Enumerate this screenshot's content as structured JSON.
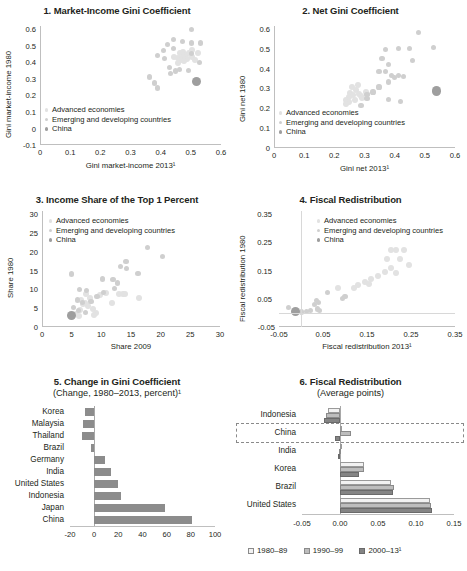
{
  "chart_data": [
    {
      "type": "scatter",
      "panel": "1",
      "title": "1. Market-Income Gini Coefficient",
      "xlabel": "Gini market-income 2013¹",
      "ylabel": "Gini market-income 1980",
      "xlim": [
        0,
        0.6
      ],
      "ylim": [
        -0.1,
        0.6
      ],
      "xticks": [
        "0",
        "0.1",
        "0.2",
        "0.3",
        "0.4",
        "0.5",
        "0.6"
      ],
      "yticks": [
        "-0.1",
        "0",
        "0.1",
        "0.2",
        "0.3",
        "0.4",
        "0.5",
        "0.6"
      ],
      "grid": false,
      "legend": [
        "Advanced economies",
        "Emerging and developing countries",
        "China"
      ],
      "series": [
        {
          "name": "Advanced economies",
          "color": "#e2e2e2",
          "points": [
            [
              0.46,
              0.44
            ],
            [
              0.47,
              0.45
            ],
            [
              0.48,
              0.43
            ],
            [
              0.47,
              0.42
            ],
            [
              0.49,
              0.44
            ],
            [
              0.485,
              0.405
            ],
            [
              0.5,
              0.42
            ],
            [
              0.455,
              0.41
            ],
            [
              0.465,
              0.4
            ],
            [
              0.5,
              0.46
            ],
            [
              0.52,
              0.44
            ],
            [
              0.51,
              0.4
            ],
            [
              0.44,
              0.42
            ],
            [
              0.455,
              0.385
            ],
            [
              0.475,
              0.395
            ]
          ]
        },
        {
          "name": "Emerging and developing countries",
          "color": "#cfcfcf",
          "points": [
            [
              0.5,
              0.58
            ],
            [
              0.44,
              0.52
            ],
            [
              0.47,
              0.51
            ],
            [
              0.42,
              0.49
            ],
            [
              0.5,
              0.5
            ],
            [
              0.53,
              0.5
            ],
            [
              0.405,
              0.455
            ],
            [
              0.44,
              0.47
            ],
            [
              0.385,
              0.425
            ],
            [
              0.41,
              0.41
            ],
            [
              0.5,
              0.44
            ],
            [
              0.525,
              0.385
            ],
            [
              0.425,
              0.355
            ],
            [
              0.46,
              0.345
            ],
            [
              0.49,
              0.34
            ],
            [
              0.445,
              0.335
            ],
            [
              0.36,
              0.3
            ],
            [
              0.375,
              0.265
            ],
            [
              0.385,
              0.235
            ],
            [
              0.43,
              0.32
            ]
          ]
        },
        {
          "name": "China",
          "color": "#9e9e9e",
          "points": [
            [
              0.515,
              0.275
            ]
          ]
        }
      ]
    },
    {
      "type": "scatter",
      "panel": "2",
      "title": "2. Net Gini Coefficient",
      "xlabel": "Gini net 2013¹",
      "ylabel": "Gini net 1980",
      "xlim": [
        0,
        0.6
      ],
      "ylim": [
        0,
        0.6
      ],
      "xticks": [
        "0",
        "0.1",
        "0.2",
        "0.3",
        "0.4",
        "0.5",
        "0.6"
      ],
      "yticks": [
        "0",
        "0.1",
        "0.2",
        "0.3",
        "0.4",
        "0.5",
        "0.6"
      ],
      "grid": false,
      "legend": [
        "Advanced economies",
        "Emerging and developing countries",
        "China"
      ],
      "series": [
        {
          "name": "Advanced economies",
          "color": "#e2e2e2",
          "points": [
            [
              0.25,
              0.27
            ],
            [
              0.26,
              0.26
            ],
            [
              0.255,
              0.3
            ],
            [
              0.27,
              0.285
            ],
            [
              0.28,
              0.265
            ],
            [
              0.245,
              0.25
            ],
            [
              0.265,
              0.235
            ],
            [
              0.285,
              0.255
            ],
            [
              0.235,
              0.235
            ],
            [
              0.3,
              0.275
            ],
            [
              0.275,
              0.31
            ],
            [
              0.29,
              0.245
            ],
            [
              0.245,
              0.225
            ],
            [
              0.305,
              0.265
            ],
            [
              0.235,
              0.215
            ]
          ]
        },
        {
          "name": "Emerging and developing countries",
          "color": "#cfcfcf",
          "points": [
            [
              0.475,
              0.57
            ],
            [
              0.445,
              0.49
            ],
            [
              0.365,
              0.485
            ],
            [
              0.41,
              0.49
            ],
            [
              0.525,
              0.495
            ],
            [
              0.455,
              0.43
            ],
            [
              0.355,
              0.44
            ],
            [
              0.375,
              0.41
            ],
            [
              0.345,
              0.375
            ],
            [
              0.365,
              0.375
            ],
            [
              0.385,
              0.355
            ],
            [
              0.41,
              0.355
            ],
            [
              0.425,
              0.35
            ],
            [
              0.395,
              0.345
            ],
            [
              0.375,
              0.325
            ],
            [
              0.345,
              0.3
            ],
            [
              0.325,
              0.275
            ],
            [
              0.305,
              0.265
            ],
            [
              0.305,
              0.245
            ],
            [
              0.375,
              0.24
            ],
            [
              0.415,
              0.23
            ],
            [
              0.285,
              0.21
            ]
          ]
        },
        {
          "name": "China",
          "color": "#9e9e9e",
          "points": [
            [
              0.535,
              0.28
            ]
          ]
        }
      ]
    },
    {
      "type": "scatter",
      "panel": "3",
      "title": "3. Income Share of the Top 1 Percent",
      "xlabel": "Share 2009",
      "ylabel": "Share 1980",
      "xlim": [
        0,
        30
      ],
      "ylim": [
        0,
        30
      ],
      "xticks": [
        "0",
        "5",
        "10",
        "15",
        "20",
        "25",
        "30"
      ],
      "yticks": [
        "0",
        "5",
        "10",
        "15",
        "20",
        "25",
        "30"
      ],
      "grid": false,
      "legend": [
        "Advanced economies",
        "Emerging and developing countries",
        "China"
      ],
      "series": [
        {
          "name": "Advanced economies",
          "color": "#e2e2e2",
          "points": [
            [
              7.2,
              8.6
            ],
            [
              8.0,
              7.6
            ],
            [
              6.4,
              7.1
            ],
            [
              9.6,
              8.4
            ],
            [
              10.6,
              8.8
            ],
            [
              6.8,
              5.9
            ],
            [
              7.6,
              5.4
            ],
            [
              8.4,
              4.6
            ],
            [
              9.0,
              3.6
            ],
            [
              6.2,
              4.3
            ],
            [
              7.0,
              6.3
            ],
            [
              11.6,
              6.1
            ],
            [
              12.8,
              8.5
            ],
            [
              13.4,
              8.6
            ],
            [
              13.8,
              8.5
            ],
            [
              16.1,
              7.6
            ],
            [
              5.6,
              3.4
            ],
            [
              6.0,
              2.9
            ],
            [
              8.6,
              3.1
            ]
          ]
        },
        {
          "name": "Emerging and developing countries",
          "color": "#cfcfcf",
          "points": [
            [
              17.6,
              20.6
            ],
            [
              20.2,
              18.2
            ],
            [
              13.0,
              15.7
            ],
            [
              14.1,
              15.2
            ],
            [
              14.0,
              16.9
            ],
            [
              16.0,
              13.8
            ],
            [
              10.0,
              12.4
            ],
            [
              11.8,
              12.2
            ],
            [
              12.5,
              11.4
            ],
            [
              4.8,
              13.7
            ],
            [
              6.2,
              9.6
            ],
            [
              7.4,
              9.4
            ],
            [
              5.8,
              7.0
            ],
            [
              6.6,
              6.4
            ],
            [
              8.1,
              6.6
            ],
            [
              9.1,
              7.9
            ],
            [
              10.2,
              9.0
            ],
            [
              12.0,
              9.9
            ],
            [
              5.2,
              5.0
            ],
            [
              6.0,
              4.2
            ],
            [
              7.2,
              3.8
            ]
          ]
        },
        {
          "name": "China",
          "color": "#9e9e9e",
          "points": [
            [
              4.8,
              2.9
            ]
          ]
        }
      ]
    },
    {
      "type": "scatter",
      "panel": "4",
      "title": "4. Fiscal Redistribution",
      "xlabel": "Fiscal redistribution 2013¹",
      "ylabel": "Fiscal redistribution 1980",
      "xlim": [
        -0.05,
        0.35
      ],
      "ylim": [
        -0.05,
        0.35
      ],
      "xticks": [
        "-0.05",
        "0.05",
        "0.15",
        "0.25",
        "0.35"
      ],
      "yticks": [
        "-0.05",
        "0.05",
        "0.15",
        "0.25",
        "0.35"
      ],
      "grid": false,
      "legend": [
        "Advanced economies",
        "Emerging and developing countries",
        "China"
      ],
      "series": [
        {
          "name": "Advanced economies",
          "color": "#e2e2e2",
          "points": [
            [
              0.205,
              0.215
            ],
            [
              0.215,
              0.215
            ],
            [
              0.235,
              0.215
            ],
            [
              0.195,
              0.185
            ],
            [
              0.225,
              0.185
            ],
            [
              0.205,
              0.155
            ],
            [
              0.245,
              0.165
            ],
            [
              0.19,
              0.14
            ],
            [
              0.215,
              0.135
            ],
            [
              0.175,
              0.125
            ],
            [
              0.16,
              0.115
            ],
            [
              0.145,
              0.105
            ],
            [
              0.13,
              0.095
            ],
            [
              0.155,
              0.1
            ],
            [
              0.12,
              0.085
            ],
            [
              0.085,
              0.085
            ]
          ]
        },
        {
          "name": "Emerging and developing countries",
          "color": "#cfcfcf",
          "points": [
            [
              0.1,
              0.055
            ],
            [
              0.095,
              0.048
            ],
            [
              0.035,
              0.04
            ],
            [
              0.04,
              0.035
            ],
            [
              0.03,
              0.028
            ],
            [
              0.038,
              0.012
            ],
            [
              0.022,
              0.006
            ],
            [
              0.012,
              0.004
            ],
            [
              -0.028,
              0.018
            ],
            [
              0.002,
              0.002
            ],
            [
              0.042,
              0.008
            ],
            [
              0.06,
              0.068
            ]
          ]
        },
        {
          "name": "China",
          "color": "#9e9e9e",
          "points": [
            [
              -0.012,
              0.004
            ]
          ]
        }
      ]
    },
    {
      "type": "bar",
      "panel": "5",
      "title": "5. Change in Gini Coefficient",
      "subtitle": "(Change, 1980–2013, percent)¹",
      "orientation": "horizontal",
      "xlabel": "",
      "ylabel": "",
      "xlim": [
        -20,
        100
      ],
      "xticks": [
        "-20",
        "0",
        "20",
        "40",
        "60",
        "80",
        "100"
      ],
      "grid": false,
      "color": "#8c8c8c",
      "categories": [
        "Korea",
        "Malaysia",
        "Thailand",
        "Brazil",
        "Germany",
        "India",
        "United States",
        "Indonesia",
        "Japan",
        "China"
      ],
      "values": [
        -8,
        -9,
        -10,
        -3,
        9,
        14,
        20,
        22,
        59,
        81
      ]
    },
    {
      "type": "bar",
      "panel": "6",
      "title": "6. Fiscal Redistribution",
      "subtitle": "(Average points)",
      "orientation": "horizontal",
      "grouped": true,
      "xlabel": "",
      "ylabel": "",
      "xlim": [
        -0.05,
        0.15
      ],
      "xticks": [
        "-0.05",
        "0.00",
        "0.05",
        "0.10",
        "0.15"
      ],
      "grid": false,
      "highlight_category": "China",
      "categories": [
        "Indonesia",
        "China",
        "India",
        "Korea",
        "Brazil",
        "United States"
      ],
      "series": [
        {
          "name": "1980–89",
          "color": "#f2f2f2",
          "values": [
            -0.016,
            0.0,
            0.0,
            0.031,
            0.067,
            0.119
          ]
        },
        {
          "name": "1990–99",
          "color": "#bdbdbd",
          "values": [
            -0.019,
            0.014,
            -0.001,
            0.032,
            0.071,
            0.12
          ]
        },
        {
          "name": "2000–13¹",
          "color": "#848484",
          "values": [
            -0.021,
            -0.006,
            -0.002,
            0.025,
            0.07,
            0.121
          ]
        }
      ]
    }
  ]
}
